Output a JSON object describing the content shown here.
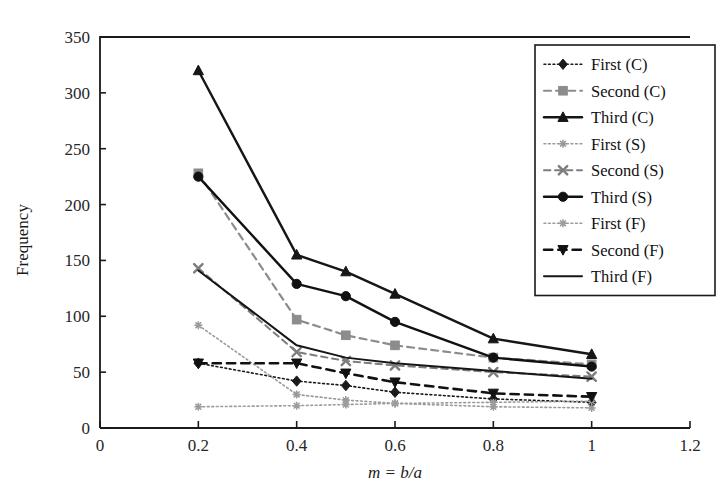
{
  "chart_data": {
    "type": "line",
    "title": "",
    "xlabel": "m = b/a",
    "ylabel": "Frequency",
    "xlim": [
      0,
      1.2
    ],
    "ylim": [
      0,
      350
    ],
    "xticks": [
      "0",
      "0.2",
      "0.4",
      "0.6",
      "0.8",
      "1",
      "1.2"
    ],
    "xtick_values": [
      0,
      0.2,
      0.4,
      0.6,
      0.8,
      1.0,
      1.2
    ],
    "yticks": [
      "0",
      "50",
      "100",
      "150",
      "200",
      "250",
      "300",
      "350"
    ],
    "ytick_values": [
      0,
      50,
      100,
      150,
      200,
      250,
      300,
      350
    ],
    "grid": false,
    "legend_position": "top-right",
    "x": [
      0.2,
      0.4,
      0.5,
      0.6,
      0.8,
      1.0
    ],
    "series": [
      {
        "name": "First (C)",
        "values": [
          58,
          42,
          38,
          32,
          26,
          23
        ],
        "marker": "diamond",
        "linestyle": "dotted",
        "color": "#1a1a1a",
        "width": 1.6
      },
      {
        "name": "Second (C)",
        "values": [
          228,
          97,
          83,
          74,
          63,
          57
        ],
        "marker": "square",
        "linestyle": "dashed",
        "color": "#8c8c8c",
        "width": 2.2
      },
      {
        "name": "Third (C)",
        "values": [
          320,
          155,
          140,
          120,
          80,
          66
        ],
        "marker": "triangle",
        "linestyle": "solid",
        "color": "#161616",
        "width": 2.4
      },
      {
        "name": "First (S)",
        "values": [
          92,
          30,
          25,
          22,
          19,
          18
        ],
        "marker": "star",
        "linestyle": "dotted",
        "color": "#9a9a9a",
        "width": 1.6
      },
      {
        "name": "Second (S)",
        "values": [
          143,
          68,
          60,
          56,
          50,
          46
        ],
        "marker": "x",
        "linestyle": "dashed",
        "color": "#7d7d7d",
        "width": 2.0
      },
      {
        "name": "Third (S)",
        "values": [
          225,
          129,
          118,
          95,
          63,
          55
        ],
        "marker": "circle",
        "linestyle": "solid",
        "color": "#111111",
        "width": 2.4
      },
      {
        "name": "First (F)",
        "values": [
          19,
          20,
          21,
          22,
          23,
          24
        ],
        "marker": "star",
        "linestyle": "dotted",
        "color": "#9c9c9c",
        "width": 1.6
      },
      {
        "name": "Second (F)",
        "values": [
          58,
          58,
          49,
          41,
          31,
          28
        ],
        "marker": "triangle-down",
        "linestyle": "dashed",
        "color": "#111111",
        "width": 2.6
      },
      {
        "name": "Third (F)",
        "values": [
          141,
          74,
          63,
          58,
          51,
          44
        ],
        "marker": "none",
        "linestyle": "solid",
        "color": "#161616",
        "width": 2.0
      }
    ]
  },
  "legend": {
    "entries": [
      {
        "label": "First (C)"
      },
      {
        "label": "Second (C)"
      },
      {
        "label": "Third (C)"
      },
      {
        "label": "First (S)"
      },
      {
        "label": "Second (S)"
      },
      {
        "label": "Third (S)"
      },
      {
        "label": "First (F)"
      },
      {
        "label": "Second (F)"
      },
      {
        "label": "Third (F)"
      }
    ]
  }
}
